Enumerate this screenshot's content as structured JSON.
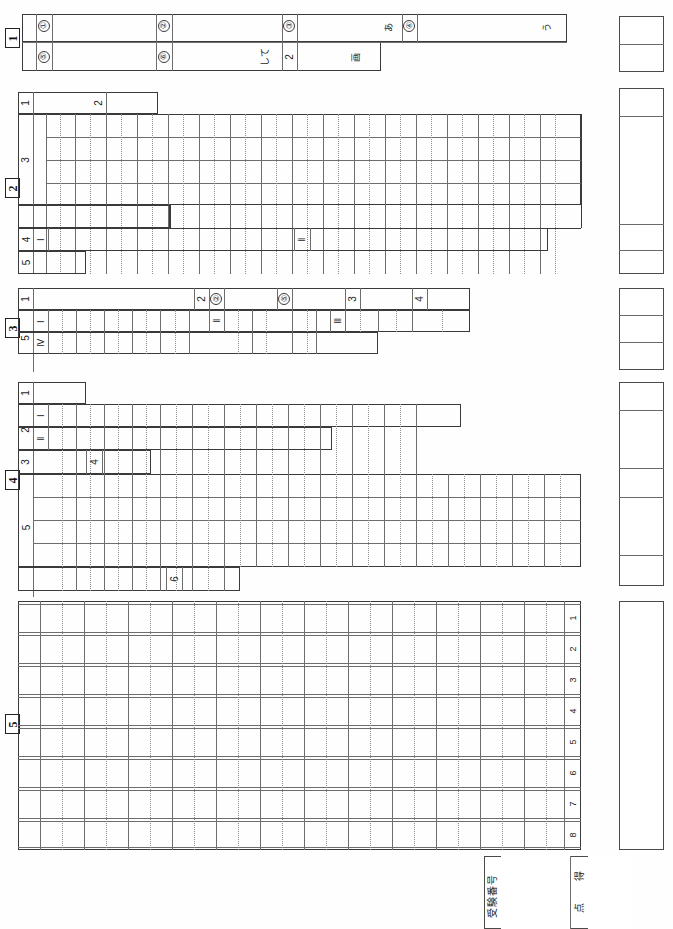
{
  "sheet": {
    "type": "exam-answer-sheet",
    "orientation": "text rotated 90 degrees (landscape content on portrait page)",
    "page_width": 673,
    "page_height": 929,
    "ink_color": "#3a3a3a",
    "grid_color": "#8d8d8d",
    "background": "#fefefe"
  },
  "sections": [
    {
      "number": "1",
      "rows": [
        {
          "label": "1",
          "items": [
            "①",
            "②",
            "③",
            "あ",
            "④",
            "う"
          ]
        },
        {
          "label": "",
          "items": [
            "⑤",
            "⑥",
            "して",
            "2",
            "画"
          ]
        }
      ]
    },
    {
      "number": "2",
      "rows": [
        {
          "label": "1",
          "items": []
        },
        {
          "label": "2",
          "items": []
        },
        {
          "label": "3",
          "items": []
        },
        {
          "label": "4",
          "items": [
            "Ⅰ",
            "Ⅱ"
          ]
        },
        {
          "label": "5",
          "items": []
        }
      ]
    },
    {
      "number": "3",
      "rows": [
        {
          "label": "1",
          "items": [
            "2",
            "②",
            "⑤",
            "3",
            "4"
          ]
        },
        {
          "label": "5",
          "items": [
            "Ⅰ",
            "Ⅱ",
            "Ⅲ",
            "Ⅳ"
          ]
        }
      ]
    },
    {
      "number": "4",
      "rows": [
        {
          "label": "1",
          "items": []
        },
        {
          "label": "2",
          "items": [
            "Ⅰ",
            "Ⅱ"
          ]
        },
        {
          "label": "3",
          "items": []
        },
        {
          "label": "4",
          "items": []
        },
        {
          "label": "5",
          "items": []
        },
        {
          "label": "6",
          "items": []
        }
      ]
    },
    {
      "number": "5",
      "line_numbers": [
        "1",
        "2",
        "3",
        "4",
        "5",
        "6",
        "7",
        "8"
      ]
    }
  ],
  "marks": {
    "section1_label": "1",
    "section2_label": "2",
    "section3_label": "3",
    "section4_label": "4",
    "section5_label": "5"
  },
  "row_labels": {
    "s1_r1": "1",
    "s2_r1": "1",
    "s2_r2": "2",
    "s2_r3": "3",
    "s2_r4": "4",
    "s2_r5": "5",
    "s3_r1": "1",
    "s3_r5": "5",
    "s4_r1": "1",
    "s4_r2": "2",
    "s4_r3": "3",
    "s4_r4": "4",
    "s4_r5": "5",
    "s4_r6": "6"
  },
  "sub_labels": {
    "s1_c1": "①",
    "s1_c2": "②",
    "s1_c3": "③",
    "s1_c4": "④",
    "s1_c5": "⑤",
    "s1_c6": "⑥",
    "s1_t_a": "あ",
    "s1_t_u": "う",
    "s1_t_shite": "して",
    "s1_t_2": "2",
    "s1_t_kaku": "画",
    "s2_I": "Ⅰ",
    "s2_II": "Ⅱ",
    "s3_2": "2",
    "s3_c2": "②",
    "s3_c5": "⑤",
    "s3_3": "3",
    "s3_4": "4",
    "s3_I": "Ⅰ",
    "s3_II": "Ⅱ",
    "s3_III": "Ⅲ",
    "s3_IV": "Ⅳ",
    "s4_I": "Ⅰ",
    "s4_II": "Ⅱ",
    "s4_4": "4",
    "s4_6": "6"
  },
  "line_numbers": [
    "1",
    "2",
    "3",
    "4",
    "5",
    "6",
    "7",
    "8"
  ],
  "footer": {
    "exam_number_label": "受験番号",
    "score_label_top": "得",
    "score_label_bottom": "点",
    "exam_number_value": "",
    "score_value": ""
  },
  "score_boxes": {
    "section1": {
      "cells": 2,
      "values": [
        "",
        ""
      ]
    },
    "section2": {
      "cells": 4,
      "values": [
        "",
        "",
        "",
        ""
      ]
    },
    "section3": {
      "cells": 3,
      "values": [
        "",
        "",
        ""
      ]
    },
    "section4": {
      "cells": 4,
      "values": [
        "",
        "",
        "",
        ""
      ]
    },
    "section5": {
      "cells": 1,
      "values": [
        ""
      ]
    }
  }
}
